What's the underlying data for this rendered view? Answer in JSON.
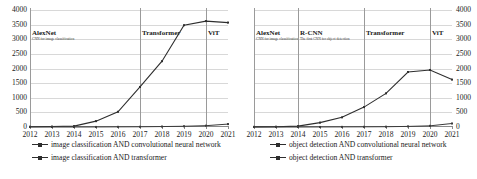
{
  "chart_data": [
    {
      "id": "left",
      "type": "line",
      "title": "",
      "xlabel": "",
      "ylabel": "",
      "x": [
        2012,
        2013,
        2014,
        2015,
        2016,
        2017,
        2018,
        2019,
        2020,
        2021
      ],
      "categories": [
        "2012",
        "2013",
        "2014",
        "2015",
        "2016",
        "2017",
        "2018",
        "2019",
        "2020",
        "2021"
      ],
      "ylim": [
        0,
        4000
      ],
      "yticks": [
        0,
        500,
        1000,
        1500,
        2000,
        2500,
        3000,
        3500,
        4000
      ],
      "ytick_labels": [
        "0",
        "500",
        "1000",
        "1500",
        "2000",
        "2500",
        "3000",
        "3500",
        "4000"
      ],
      "y_axis_side": "left",
      "grid": true,
      "legend_position": "bottom",
      "series": [
        {
          "name": "image classification AND convolutional neural network",
          "values": [
            10,
            15,
            30,
            200,
            520,
            1370,
            2250,
            3480,
            3620,
            3570
          ]
        },
        {
          "name": "image classification AND transformer",
          "values": [
            0,
            0,
            0,
            2,
            5,
            8,
            15,
            25,
            45,
            100
          ]
        }
      ],
      "annotations": [
        {
          "x": 2012,
          "title": "AlexNet",
          "sub": "CNN for image classification"
        },
        {
          "x": 2017,
          "title": "Transformer",
          "sub": ""
        },
        {
          "x": 2020,
          "title": "ViT",
          "sub": ""
        }
      ]
    },
    {
      "id": "right",
      "type": "line",
      "title": "",
      "xlabel": "",
      "ylabel": "",
      "x": [
        2012,
        2013,
        2014,
        2015,
        2016,
        2017,
        2018,
        2019,
        2020,
        2021
      ],
      "categories": [
        "2012",
        "2013",
        "2014",
        "2015",
        "2016",
        "2017",
        "2018",
        "2019",
        "2020",
        "2021"
      ],
      "ylim": [
        0,
        4000
      ],
      "yticks": [
        0,
        500,
        1000,
        1500,
        2000,
        2500,
        3000,
        3500,
        4000
      ],
      "ytick_labels": [
        "0",
        "500",
        "1000",
        "1500",
        "2000",
        "2500",
        "3000",
        "3500",
        "4000"
      ],
      "y_axis_side": "right",
      "grid": true,
      "legend_position": "bottom",
      "series": [
        {
          "name": "object detection AND convolutional neural network",
          "values": [
            5,
            10,
            30,
            150,
            330,
            680,
            1150,
            1880,
            1950,
            1620
          ]
        },
        {
          "name": "object detection AND transformer",
          "values": [
            0,
            0,
            0,
            2,
            4,
            6,
            10,
            20,
            40,
            120
          ]
        }
      ],
      "annotations": [
        {
          "x": 2012,
          "title": "AlexNet",
          "sub": "CNN for image classification"
        },
        {
          "x": 2014,
          "title": "R-CNN",
          "sub": "The first CNN for object detection"
        },
        {
          "x": 2017,
          "title": "Transformer",
          "sub": ""
        },
        {
          "x": 2020,
          "title": "ViT",
          "sub": ""
        }
      ]
    }
  ],
  "style": {
    "line_color": "#2e2e2e",
    "grid_color": "#d8d8d8",
    "axis_color": "#8a8a8a",
    "marker_line_color": "#9a9a9a",
    "text_color": "#1a1a1a"
  }
}
